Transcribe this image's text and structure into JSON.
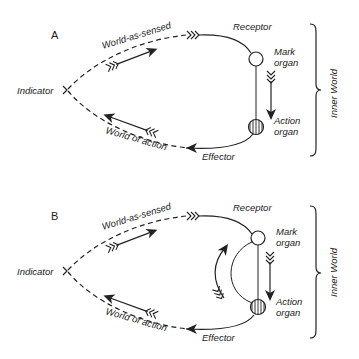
{
  "figure": {
    "panels": [
      {
        "id": "A",
        "label": "A",
        "indicator_label": "Indicator",
        "world_as_sensed_label": "World-as-sensed",
        "world_of_action_label": "World of action",
        "receptor_label": "Receptor",
        "effector_label": "Effector",
        "mark_organ_label_line1": "Mark",
        "mark_organ_label_line2": "organ",
        "action_organ_label_line1": "Action",
        "action_organ_label_line2": "organ",
        "inner_world_label": "Inner World",
        "has_feedback_loop": false
      },
      {
        "id": "B",
        "label": "B",
        "indicator_label": "Indicator",
        "world_as_sensed_label": "World-as-sensed",
        "world_of_action_label": "World of action",
        "receptor_label": "Receptor",
        "effector_label": "Effector",
        "mark_organ_label_line1": "Mark",
        "mark_organ_label_line2": "organ",
        "action_organ_label_line1": "Action",
        "action_organ_label_line2": "organ",
        "inner_world_label": "Inner World",
        "has_feedback_loop": true
      }
    ],
    "colors": {
      "ink": "#222222",
      "background": "#ffffff"
    }
  }
}
